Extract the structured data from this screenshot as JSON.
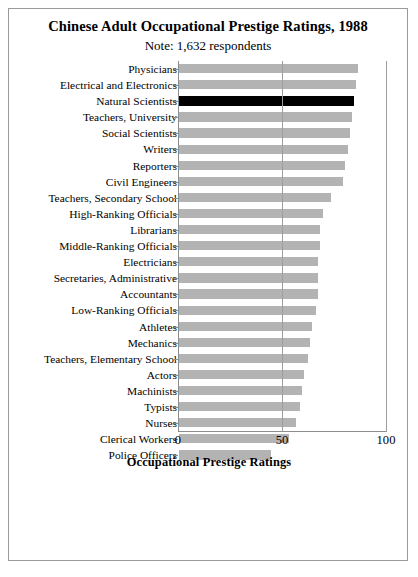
{
  "figure": {
    "title": "Chinese Adult Occupational Prestige Ratings, 1988",
    "subtitle": "Note: 1,632 respondents"
  },
  "axis": {
    "xlabel": "Occupational Prestige Ratings",
    "ticks": [
      "0",
      "50",
      "100"
    ]
  },
  "chart_data": {
    "type": "bar",
    "orientation": "horizontal",
    "title": "Chinese Adult Occupational Prestige Ratings, 1988",
    "subtitle": "Note: 1,632 respondents",
    "xlabel": "Occupational Prestige Ratings",
    "ylabel": "",
    "xlim": [
      0,
      100
    ],
    "xticks": [
      0,
      50,
      100
    ],
    "grid": true,
    "legend": null,
    "highlight_category": "Natural Scientists",
    "highlight_color": "#000000",
    "bar_color": "#b3b3b3",
    "categories": [
      "Physicians",
      "Electrical and Electronics",
      "Natural Scientists",
      "Teachers, University",
      "Social Scientists",
      "Writers",
      "Reporters",
      "Civil Engineers",
      "Teachers, Secondary School",
      "High-Ranking Officials",
      "Librarians",
      "Middle-Ranking Officials",
      "Electricians",
      "Secretaries, Administrative",
      "Accountants",
      "Low-Ranking Officials",
      "Athletes",
      "Mechanics",
      "Teachers, Elementary School",
      "Actors",
      "Machinists",
      "Typists",
      "Nurses",
      "Clerical Workers",
      "Police Officers"
    ],
    "values": [
      86,
      85,
      84,
      83,
      82,
      81,
      80,
      79,
      73,
      69,
      68,
      68,
      67,
      67,
      67,
      66,
      64,
      63,
      62,
      60,
      59,
      58,
      56,
      53,
      44
    ]
  }
}
